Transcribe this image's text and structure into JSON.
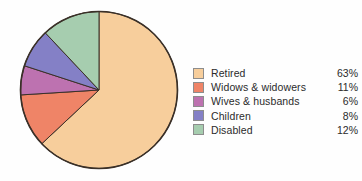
{
  "chart_data": {
    "type": "pie",
    "title": "",
    "categories": [
      "Retired",
      "Widows & widowers",
      "Wives & husbands",
      "Children",
      "Disabled"
    ],
    "values": [
      63,
      11,
      6,
      8,
      12
    ],
    "value_labels": [
      "63%",
      "11%",
      "6%",
      "8%",
      "12%"
    ],
    "colors": [
      "#f7ce9c",
      "#ef8467",
      "#bd72b0",
      "#8480c6",
      "#a6cdaf"
    ],
    "unit": "%",
    "start_angle_deg": 0,
    "direction": "clockwise",
    "legend_position": "right",
    "grid": false,
    "stroke_color": "#3a3028",
    "background": "#fefefe"
  },
  "legend": {
    "rows": [
      {
        "label": "Retired",
        "value": "63%",
        "color": "#f7ce9c",
        "swatch_name": "legend-swatch-retired"
      },
      {
        "label": "Widows & widowers",
        "value": "11%",
        "color": "#ef8467",
        "swatch_name": "legend-swatch-widows-widowers"
      },
      {
        "label": "Wives & husbands",
        "value": "6%",
        "color": "#bd72b0",
        "swatch_name": "legend-swatch-wives-husbands"
      },
      {
        "label": "Children",
        "value": "8%",
        "color": "#8480c6",
        "swatch_name": "legend-swatch-children"
      },
      {
        "label": "Disabled",
        "value": "12%",
        "color": "#a6cdaf",
        "swatch_name": "legend-swatch-disabled"
      }
    ]
  }
}
